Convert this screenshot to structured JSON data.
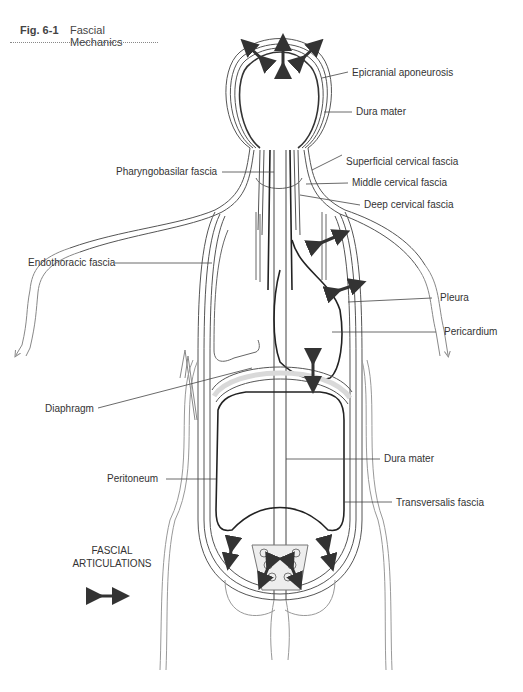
{
  "figure": {
    "number": "Fig. 6-1",
    "title": "Fascial Mechanics"
  },
  "labels": {
    "epicranial_aponeurosis": "Epicranial aponeurosis",
    "dura_mater_top": "Dura mater",
    "pharyngobasilar_fascia": "Pharyngobasilar fascia",
    "superficial_cervical_fascia": "Superficial cervical fascia",
    "middle_cervical_fascia": "Middle cervical fascia",
    "deep_cervical_fascia": "Deep cervical fascia",
    "endothoracic_fascia": "Endothoracic fascia",
    "pleura": "Pleura",
    "pericardium": "Pericardium",
    "diaphragm": "Diaphragm",
    "dura_mater_bottom": "Dura mater",
    "peritoneum": "Peritoneum",
    "transversalis_fascia": "Transversalis fascia"
  },
  "legend": {
    "line1": "FASCIAL",
    "line2": "ARTICULATIONS",
    "symbol": "double-headed-arrow-icon"
  },
  "colors": {
    "text": "#333333",
    "outline": "#555555",
    "arrow": "#333333",
    "leader": "#444444",
    "shading": "#d9d9d9"
  }
}
